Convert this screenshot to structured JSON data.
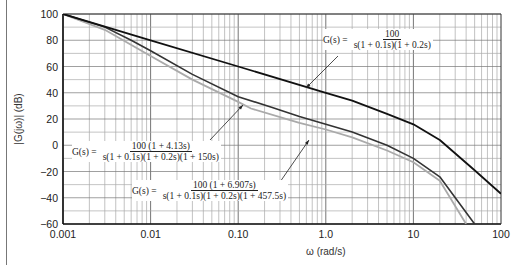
{
  "chart_data": {
    "type": "line",
    "title": "",
    "xlabel": "ω (rad/s)",
    "ylabel": "|G(jω)| (dB)",
    "xscale": "log",
    "xlim": [
      0.001,
      100
    ],
    "ylim": [
      -60,
      100
    ],
    "x_ticks": [
      "0.001",
      "0.01",
      "0.10",
      "1.0",
      "10",
      "100"
    ],
    "y_ticks": [
      "100",
      "80",
      "60",
      "40",
      "20",
      "0",
      "−20",
      "−40",
      "−60"
    ],
    "grid": true,
    "series": [
      {
        "name": "G(s) = 100 / [s(1 + 0.1s)(1 + 0.2s)]",
        "color": "#111111",
        "x": [
          0.001,
          0.01,
          0.1,
          1,
          2,
          5,
          10,
          20,
          50,
          100
        ],
        "y": [
          100,
          80,
          60,
          40,
          34,
          24,
          16,
          4,
          -19,
          -37
        ]
      },
      {
        "name": "G(s) = 100(1 + 4.13s) / [s(1 + 0.1s)(1 + 0.2s)(1 + 150s)]",
        "color": "#333333",
        "x": [
          0.001,
          0.003,
          0.006,
          0.01,
          0.03,
          0.1,
          0.24,
          0.5,
          1,
          2,
          5,
          10,
          20,
          50
        ],
        "y": [
          100,
          90,
          80,
          72,
          54,
          37,
          29,
          22,
          16,
          10,
          0,
          -10,
          -24,
          -60
        ]
      },
      {
        "name": "G(s) = 100(1 + 6.907s) / [s(1 + 0.1s)(1 + 0.2s)(1 + 457.5s)]",
        "color": "#aaaaaa",
        "x": [
          0.001,
          0.003,
          0.01,
          0.03,
          0.1,
          0.14,
          0.5,
          1,
          2,
          5,
          10,
          20,
          40
        ],
        "y": [
          100,
          88,
          68,
          50,
          33,
          28,
          17,
          12,
          6,
          -4,
          -13,
          -27,
          -60
        ]
      }
    ],
    "annotations": [
      {
        "text": "G(s) = 100 / s(1 + 0.1s)(1 + 0.2s)",
        "lhs": "G(s) =",
        "num": "100",
        "den": "s(1 + 0.1s)(1 + 0.2s)"
      },
      {
        "text": "G(s) = 100 (1 + 4.13s) / s(1 + 0.1s)(1 + 0.2s)(1 + 150s)",
        "lhs": "G(s) =",
        "num": "100 (1 + 4.13s)",
        "den": "s(1 + 0.1s)(1 + 0.2s)(1 + 150s)"
      },
      {
        "text": "G(s) = 100 (1 + 6.907s) / s(1 + 0.1s)(1 + 0.2s)(1 + 457.5s)",
        "lhs": "G(s) =",
        "num": "100 (1 + 6.907s)",
        "den": "s(1 + 0.1s)(1 + 0.2s)(1 + 457.5s)"
      }
    ],
    "legend": "none (curves labeled via arrow annotations)"
  }
}
